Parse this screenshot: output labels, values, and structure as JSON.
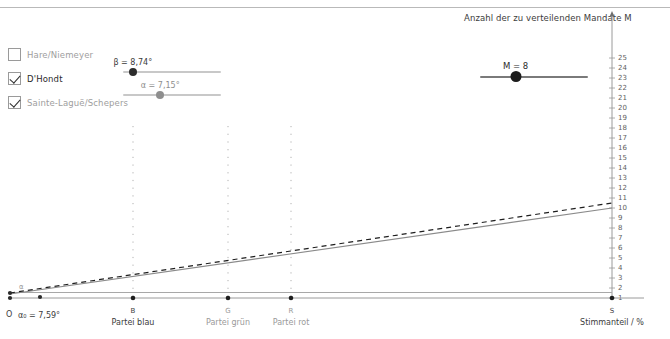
{
  "methods": {
    "title": "Sitzzuteilungsverfahren",
    "items": [
      {
        "label": "Hare/Niemeyer",
        "checked": false,
        "active": false
      },
      {
        "label": "D'Hondt",
        "checked": true,
        "active": true
      },
      {
        "label": "Sainte-Laguë/Schepers",
        "checked": true,
        "active": false
      }
    ]
  },
  "sliders": {
    "beta": {
      "label": "β = 8,74°",
      "value": 8.74,
      "min": 0,
      "max": 90,
      "handle_pct": 10,
      "color": "#2c2c2c"
    },
    "alpha": {
      "label": "α = 7,15°",
      "value": 7.15,
      "min": 0,
      "max": 90,
      "handle_pct": 38,
      "color": "#8e8e8e"
    },
    "mandate": {
      "label": "M = 8",
      "value": 8,
      "min": 1,
      "max": 25,
      "handle_pct": 33,
      "color": "#1c1c1c"
    }
  },
  "mandate_caption": "Anzahl der zu verteilenden Mandate M",
  "chart_data": {
    "type": "line",
    "title": "",
    "xlabel": "Stimmanteil / %",
    "ylabel": "",
    "ylim": [
      0,
      26
    ],
    "xlim": [
      0,
      100
    ],
    "grid": false,
    "y_ticks": [
      1,
      2,
      3,
      4,
      5,
      6,
      7,
      8,
      9,
      10,
      11,
      12,
      13,
      14,
      15,
      16,
      17,
      18,
      19,
      20,
      21,
      22,
      23,
      24,
      25
    ],
    "x_axis_origin_label": "O",
    "x_markers": [
      {
        "key": "B",
        "short": "B",
        "label": "Partei blau",
        "x_px": 133,
        "dim": false
      },
      {
        "key": "G",
        "short": "G",
        "label": "Partei grün",
        "x_px": 228,
        "dim": true
      },
      {
        "key": "R",
        "short": "R",
        "label": "Partei rot",
        "x_px": 291,
        "dim": true
      },
      {
        "key": "S",
        "short": "S",
        "label": "Stimmanteil / %",
        "x_px": 612,
        "dim": false
      }
    ],
    "annotations": [
      {
        "name": "alpha-zero",
        "text": "α₀ = 7,59°",
        "x_px": 16,
        "y_px": 315
      },
      {
        "name": "alpha-angle",
        "text": "α",
        "x_px": 22,
        "y_px": 287
      }
    ],
    "series": [
      {
        "name": "D'Hondt",
        "style": "dashed",
        "color": "#1e1e1e",
        "x0": 10,
        "y0": 0.45,
        "x1": 612,
        "y1": 9.0
      },
      {
        "name": "Sainte-Laguë/Schepers",
        "style": "solid",
        "color": "#8a8a8a",
        "x0": 10,
        "y0": 0.3,
        "x1": 612,
        "y1": 8.1
      },
      {
        "name": "baseline",
        "style": "solid",
        "color": "#9a9a9a",
        "x0": 10,
        "y0": 0.0,
        "x1": 612,
        "y1": 0.0
      }
    ]
  }
}
